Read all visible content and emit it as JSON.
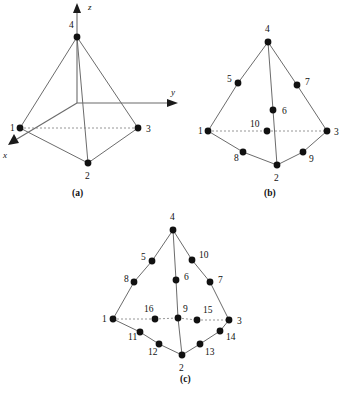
{
  "figure": {
    "background_color": "#ffffff",
    "ink_color": "#111111",
    "edge_color": "#5a5a5a",
    "dashed_edge_color": "#8a8a8a",
    "width": 343,
    "height": 394
  },
  "panels": [
    {
      "id": "a",
      "caption": "(a)",
      "caption_pos": {
        "x": 72,
        "y": 196
      },
      "element_name": "4-node tetrahedron",
      "axes": [
        {
          "name": "z",
          "label": "z",
          "label_pos": {
            "x": 88,
            "y": 10
          },
          "line": {
            "x1": 77,
            "y1": 103,
            "x2": 77,
            "y2": 12
          },
          "head": "77,3 73,13 81,13"
        },
        {
          "name": "y",
          "label": "y",
          "label_pos": {
            "x": 171,
            "y": 95
          },
          "line": {
            "x1": 77,
            "y1": 103,
            "x2": 168,
            "y2": 103
          },
          "head": "178,103 167,99 167,107"
        },
        {
          "name": "x",
          "label": "x",
          "label_pos": {
            "x": 3,
            "y": 158
          },
          "line": {
            "x1": 77,
            "y1": 103,
            "x2": 17,
            "y2": 139
          },
          "head": "8,145 19,143 14,134"
        }
      ],
      "nodes": [
        {
          "id": "1",
          "x": 20,
          "y": 128,
          "label_pos": {
            "x": 10,
            "y": 131
          }
        },
        {
          "id": "2",
          "x": 88,
          "y": 163,
          "label_pos": {
            "x": 85,
            "y": 179
          }
        },
        {
          "id": "3",
          "x": 138,
          "y": 128,
          "label_pos": {
            "x": 146,
            "y": 132
          }
        },
        {
          "id": "4",
          "x": 77,
          "y": 37,
          "label_pos": {
            "x": 69,
            "y": 28
          }
        }
      ],
      "edges_solid": [
        {
          "from": "1",
          "to": "2"
        },
        {
          "from": "2",
          "to": "3"
        },
        {
          "from": "1",
          "to": "4"
        },
        {
          "from": "2",
          "to": "4"
        },
        {
          "from": "3",
          "to": "4"
        }
      ],
      "edges_dashed": [
        {
          "from": "1",
          "to": "3"
        }
      ]
    },
    {
      "id": "b",
      "caption": "(b)",
      "caption_pos": {
        "x": 264,
        "y": 196
      },
      "element_name": "10-node tetrahedron",
      "axes": [],
      "nodes": [
        {
          "id": "1",
          "x": 208,
          "y": 131,
          "label_pos": {
            "x": 198,
            "y": 134
          }
        },
        {
          "id": "2",
          "x": 277,
          "y": 165,
          "label_pos": {
            "x": 274,
            "y": 181
          }
        },
        {
          "id": "3",
          "x": 327,
          "y": 131,
          "label_pos": {
            "x": 334,
            "y": 135
          }
        },
        {
          "id": "4",
          "x": 268,
          "y": 42,
          "label_pos": {
            "x": 265,
            "y": 32
          }
        },
        {
          "id": "5",
          "x": 238,
          "y": 83,
          "label_pos": {
            "x": 227,
            "y": 82
          }
        },
        {
          "id": "6",
          "x": 273,
          "y": 110,
          "label_pos": {
            "x": 282,
            "y": 114
          }
        },
        {
          "id": "7",
          "x": 297,
          "y": 85,
          "label_pos": {
            "x": 305,
            "y": 85
          }
        },
        {
          "id": "8",
          "x": 243,
          "y": 152,
          "label_pos": {
            "x": 234,
            "y": 161
          }
        },
        {
          "id": "9",
          "x": 303,
          "y": 152,
          "label_pos": {
            "x": 309,
            "y": 162
          }
        },
        {
          "id": "10",
          "x": 267,
          "y": 131,
          "label_pos": {
            "x": 250,
            "y": 127
          }
        }
      ],
      "edges_solid": [
        {
          "from": "1",
          "to": "8"
        },
        {
          "from": "8",
          "to": "2"
        },
        {
          "from": "2",
          "to": "9"
        },
        {
          "from": "9",
          "to": "3"
        },
        {
          "from": "1",
          "to": "5"
        },
        {
          "from": "5",
          "to": "4"
        },
        {
          "from": "4",
          "to": "6"
        },
        {
          "from": "6",
          "to": "2"
        },
        {
          "from": "4",
          "to": "7"
        },
        {
          "from": "7",
          "to": "3"
        }
      ],
      "edges_dashed": [
        {
          "from": "1",
          "to": "10"
        },
        {
          "from": "10",
          "to": "3"
        }
      ]
    },
    {
      "id": "c",
      "caption": "(c)",
      "caption_pos": {
        "x": 180,
        "y": 382
      },
      "element_name": "16-node tetrahedron",
      "axes": [],
      "nodes": [
        {
          "id": "1",
          "x": 113,
          "y": 319,
          "label_pos": {
            "x": 102,
            "y": 322
          }
        },
        {
          "id": "2",
          "x": 182,
          "y": 355,
          "label_pos": {
            "x": 179,
            "y": 371
          }
        },
        {
          "id": "3",
          "x": 229,
          "y": 320,
          "label_pos": {
            "x": 237,
            "y": 324
          }
        },
        {
          "id": "4",
          "x": 173,
          "y": 230,
          "label_pos": {
            "x": 170,
            "y": 220
          }
        },
        {
          "id": "5",
          "x": 152,
          "y": 261,
          "label_pos": {
            "x": 141,
            "y": 260
          }
        },
        {
          "id": "6",
          "x": 176,
          "y": 280,
          "label_pos": {
            "x": 184,
            "y": 280
          }
        },
        {
          "id": "7",
          "x": 210,
          "y": 282,
          "label_pos": {
            "x": 218,
            "y": 283
          }
        },
        {
          "id": "8",
          "x": 134,
          "y": 282,
          "label_pos": {
            "x": 124,
            "y": 282
          }
        },
        {
          "id": "9",
          "x": 178,
          "y": 318,
          "label_pos": {
            "x": 183,
            "y": 312
          }
        },
        {
          "id": "10",
          "x": 192,
          "y": 260,
          "label_pos": {
            "x": 199,
            "y": 258
          }
        },
        {
          "id": "11",
          "x": 140,
          "y": 332,
          "label_pos": {
            "x": 128,
            "y": 340
          }
        },
        {
          "id": "12",
          "x": 159,
          "y": 344,
          "label_pos": {
            "x": 148,
            "y": 355
          }
        },
        {
          "id": "13",
          "x": 200,
          "y": 344,
          "label_pos": {
            "x": 205,
            "y": 355
          }
        },
        {
          "id": "14",
          "x": 220,
          "y": 331,
          "label_pos": {
            "x": 226,
            "y": 340
          }
        },
        {
          "id": "15",
          "x": 197,
          "y": 320,
          "label_pos": {
            "x": 203,
            "y": 313
          }
        },
        {
          "id": "16",
          "x": 155,
          "y": 319,
          "label_pos": {
            "x": 144,
            "y": 312
          }
        }
      ],
      "edges_solid": [
        {
          "from": "1",
          "to": "11"
        },
        {
          "from": "11",
          "to": "12"
        },
        {
          "from": "12",
          "to": "2"
        },
        {
          "from": "2",
          "to": "13"
        },
        {
          "from": "13",
          "to": "14"
        },
        {
          "from": "14",
          "to": "3"
        },
        {
          "from": "1",
          "to": "8"
        },
        {
          "from": "8",
          "to": "5"
        },
        {
          "from": "5",
          "to": "4"
        },
        {
          "from": "4",
          "to": "6"
        },
        {
          "from": "6",
          "to": "9"
        },
        {
          "from": "9",
          "to": "2"
        },
        {
          "from": "4",
          "to": "10"
        },
        {
          "from": "10",
          "to": "7"
        },
        {
          "from": "7",
          "to": "3"
        }
      ],
      "edges_dashed": [
        {
          "from": "1",
          "to": "16"
        },
        {
          "from": "16",
          "to": "9"
        },
        {
          "from": "9",
          "to": "15"
        },
        {
          "from": "15",
          "to": "3"
        }
      ]
    }
  ]
}
